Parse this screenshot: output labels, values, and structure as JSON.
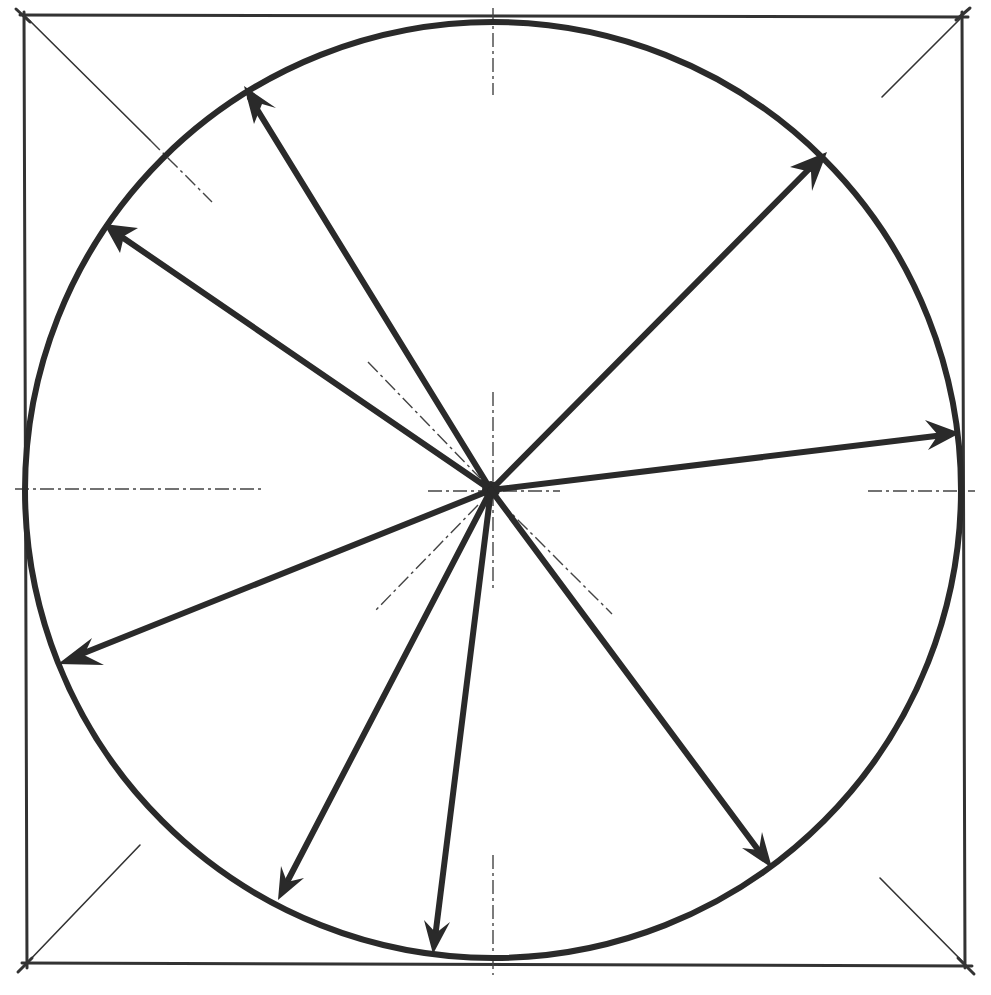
{
  "diagram": {
    "title": "Circle inscribed in a square with radii drawn from the center",
    "colors": {
      "ink": "#2a2a2a",
      "background": "#ffffff"
    },
    "square": {
      "x1": 24,
      "y1": 15,
      "x2": 965,
      "y2": 965
    },
    "circle": {
      "cx": 493,
      "cy": 490,
      "r": 468
    },
    "center_point": {
      "x": 491,
      "y": 490
    },
    "radii_arrows": [
      {
        "id": "arrow-upper-left-steep",
        "to_x": 244,
        "to_y": 88
      },
      {
        "id": "arrow-upper-left",
        "to_x": 105,
        "to_y": 225
      },
      {
        "id": "arrow-upper-right",
        "to_x": 826,
        "to_y": 153
      },
      {
        "id": "arrow-right",
        "to_x": 958,
        "to_y": 433
      },
      {
        "id": "arrow-lower-left",
        "to_x": 60,
        "to_y": 663
      },
      {
        "id": "arrow-bottom-left",
        "to_x": 278,
        "to_y": 898
      },
      {
        "id": "arrow-bottom",
        "to_x": 432,
        "to_y": 952
      },
      {
        "id": "arrow-bottom-right",
        "to_x": 772,
        "to_y": 866
      }
    ],
    "construction_lines": {
      "diagonals": "corner-to-corner guide lines, partially drawn",
      "axes": "dash-dot horizontal and vertical center lines"
    }
  }
}
